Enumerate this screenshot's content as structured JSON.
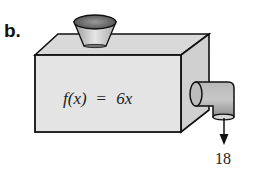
{
  "part_label": "b.",
  "machine": {
    "function_name": "f(x)",
    "equals": "=",
    "rule": "6x",
    "output_value": "18"
  },
  "colors": {
    "box_face": "#e2e2e2",
    "box_top": "#d6d6d6",
    "box_side": "#cfcfcf",
    "outline": "#111111"
  }
}
